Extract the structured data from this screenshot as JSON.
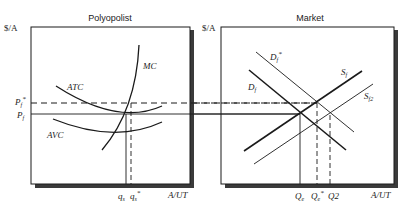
{
  "panels": {
    "left": {
      "title": "Polyopolist",
      "y_axis_label": "$/A",
      "x_axis_label": "A/UT",
      "price_labels": {
        "p_star": "P",
        "p_star_sub": "f",
        "p_star_sup": "*",
        "p": "P",
        "p_sub": "f"
      },
      "curves": {
        "mc": "MC",
        "atc": "ATC",
        "avc": "AVC"
      },
      "quantity_labels": {
        "q": "q",
        "q_sub": "s",
        "q_star": "q",
        "q_star_sub": "s",
        "q_star_sup": "*"
      }
    },
    "right": {
      "title": "Market",
      "y_axis_label": "$/A",
      "x_axis_label": "A/UT",
      "curves": {
        "d_star": "D",
        "d_star_sub": "f",
        "d_star_sup": "*",
        "d": "D",
        "d_sub": "f",
        "s": "S",
        "s_sub": "f",
        "s2": "S",
        "s2_sub": "f2"
      },
      "quantity_labels": {
        "qe": "Q",
        "qe_sub": "e",
        "qe_star": "Q",
        "qe_star_sub": "e",
        "qe_star_sup": "*",
        "q2": "Q2"
      }
    }
  },
  "colors": {
    "line": "#1a1a1a",
    "shadow": "#3a3a3a"
  }
}
